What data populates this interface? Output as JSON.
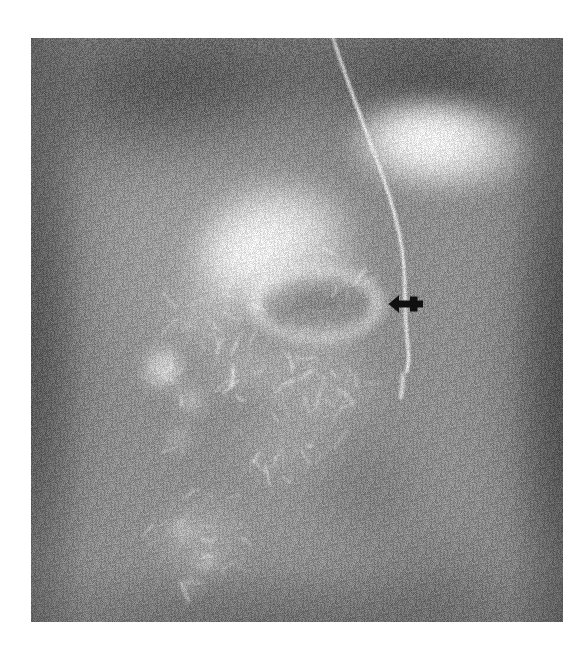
{
  "page": {
    "background_color": "#ffffff",
    "width": 587,
    "height": 653
  },
  "figure": {
    "modality": "radiograph",
    "study_type": "Barium contrast upper gastrointestinal series (abdominal radiograph)",
    "frame": {
      "left": 31,
      "top": 38,
      "width": 532,
      "height": 584
    },
    "film_base_color": "#8d8d8d",
    "grain": {
      "enabled": true,
      "amplitude": 26
    },
    "view": "anteroposterior / supine abdomen"
  },
  "annotations": [
    {
      "name": "arrow-marker",
      "icon": "arrow-left-icon",
      "direction": "left",
      "color": "#0d0d0d",
      "x": 355,
      "y": 254,
      "width": 40,
      "height": 24,
      "points_at": "ring-shaped barium-outlined lesion at the duodenal bulb / gastric antrum junction"
    }
  ],
  "anatomy_features": [
    {
      "name": "left-hemidiaphragm-shadow",
      "kind": "dark",
      "cx": 120,
      "cy": 55,
      "rx": 150,
      "ry": 70,
      "intensity": -70,
      "blur": 34
    },
    {
      "name": "right-hemidiaphragm-shadow",
      "kind": "dark",
      "cx": 430,
      "cy": 50,
      "rx": 140,
      "ry": 72,
      "intensity": -72,
      "blur": 34
    },
    {
      "name": "upper-central-dark-band",
      "kind": "dark",
      "cx": 280,
      "cy": 40,
      "rx": 190,
      "ry": 42,
      "intensity": -48,
      "blur": 30
    },
    {
      "name": "left-flank-soft-tissue",
      "kind": "dark",
      "cx": 8,
      "cy": 300,
      "rx": 46,
      "ry": 300,
      "intensity": -58,
      "blur": 30
    },
    {
      "name": "right-flank-soft-tissue",
      "kind": "dark",
      "cx": 528,
      "cy": 330,
      "rx": 52,
      "ry": 300,
      "intensity": -62,
      "blur": 30
    },
    {
      "name": "bottom-edge-shadow",
      "kind": "dark",
      "cx": 266,
      "cy": 584,
      "rx": 300,
      "ry": 40,
      "intensity": -34,
      "blur": 28
    },
    {
      "name": "liver-field",
      "kind": "light",
      "cx": 165,
      "cy": 215,
      "rx": 140,
      "ry": 145,
      "intensity": 26,
      "blur": 40
    },
    {
      "name": "stomach-body-barium",
      "kind": "light",
      "cx": 412,
      "cy": 110,
      "rx": 100,
      "ry": 52,
      "intensity": 120,
      "blur": 10
    },
    {
      "name": "stomach-fundus-barium",
      "kind": "light",
      "cx": 392,
      "cy": 96,
      "rx": 78,
      "ry": 38,
      "intensity": 120,
      "blur": 12
    },
    {
      "name": "antrum-barium-pool",
      "kind": "light",
      "cx": 248,
      "cy": 196,
      "rx": 86,
      "ry": 62,
      "intensity": 125,
      "blur": 12
    },
    {
      "name": "antrum-barium-lobe",
      "kind": "light",
      "cx": 210,
      "cy": 226,
      "rx": 62,
      "ry": 52,
      "intensity": 118,
      "blur": 14
    },
    {
      "name": "duodenal-bulb-ring",
      "kind": "ring",
      "cx": 285,
      "cy": 266,
      "rx": 62,
      "ry": 34,
      "thickness": 11,
      "intensity": 80,
      "blur": 6
    },
    {
      "name": "duodenal-ring-inner-lucency",
      "kind": "dark",
      "cx": 285,
      "cy": 266,
      "rx": 44,
      "ry": 20,
      "intensity": -26,
      "blur": 9
    },
    {
      "name": "pylorus-channel",
      "kind": "light",
      "cx": 305,
      "cy": 232,
      "rx": 46,
      "ry": 20,
      "intensity": 52,
      "blur": 12
    },
    {
      "name": "proximal-jejunum-loop",
      "kind": "light",
      "cx": 180,
      "cy": 278,
      "rx": 58,
      "ry": 34,
      "intensity": 44,
      "blur": 16
    },
    {
      "name": "duodenal-sweep-barium",
      "kind": "light",
      "cx": 290,
      "cy": 300,
      "rx": 54,
      "ry": 34,
      "intensity": 40,
      "blur": 16
    },
    {
      "name": "bowel-loop-left-upper",
      "kind": "light",
      "cx": 132,
      "cy": 330,
      "rx": 24,
      "ry": 26,
      "intensity": 98,
      "blur": 7
    },
    {
      "name": "bowel-loop-left-mid",
      "kind": "light",
      "cx": 160,
      "cy": 362,
      "rx": 16,
      "ry": 18,
      "intensity": 70,
      "blur": 8
    },
    {
      "name": "bowel-loop-left-lower",
      "kind": "light",
      "cx": 148,
      "cy": 400,
      "rx": 14,
      "ry": 14,
      "intensity": 60,
      "blur": 8
    },
    {
      "name": "jejunal-fold-cluster-a",
      "kind": "light",
      "cx": 220,
      "cy": 330,
      "rx": 58,
      "ry": 30,
      "intensity": 44,
      "blur": 14
    },
    {
      "name": "jejunal-fold-cluster-b",
      "kind": "light",
      "cx": 290,
      "cy": 352,
      "rx": 66,
      "ry": 34,
      "intensity": 40,
      "blur": 16
    },
    {
      "name": "jejunal-fold-cluster-c",
      "kind": "light",
      "cx": 256,
      "cy": 404,
      "rx": 60,
      "ry": 36,
      "intensity": 30,
      "blur": 18
    },
    {
      "name": "ileal-loop-cluster",
      "kind": "light",
      "cx": 170,
      "cy": 500,
      "rx": 52,
      "ry": 48,
      "intensity": 36,
      "blur": 14
    },
    {
      "name": "ileal-loop-bright-a",
      "kind": "light",
      "cx": 152,
      "cy": 492,
      "rx": 14,
      "ry": 12,
      "intensity": 62,
      "blur": 7
    },
    {
      "name": "ileal-loop-bright-b",
      "kind": "light",
      "cx": 176,
      "cy": 524,
      "rx": 13,
      "ry": 11,
      "intensity": 66,
      "blur": 7
    },
    {
      "name": "ileal-loop-bright-c",
      "kind": "light",
      "cx": 158,
      "cy": 548,
      "rx": 12,
      "ry": 10,
      "intensity": 58,
      "blur": 7
    },
    {
      "name": "mid-abdomen-gas",
      "kind": "dark",
      "cx": 330,
      "cy": 452,
      "rx": 60,
      "ry": 60,
      "intensity": -26,
      "blur": 24
    },
    {
      "name": "pelvic-gas-shadow",
      "kind": "dark",
      "cx": 410,
      "cy": 540,
      "rx": 80,
      "ry": 60,
      "intensity": -22,
      "blur": 26
    },
    {
      "name": "spine-column",
      "kind": "light",
      "cx": 290,
      "cy": 430,
      "rx": 42,
      "ry": 160,
      "intensity": 16,
      "blur": 34
    },
    {
      "name": "psoas-right",
      "kind": "light",
      "cx": 230,
      "cy": 470,
      "rx": 34,
      "ry": 120,
      "intensity": 12,
      "blur": 30
    }
  ],
  "tube": {
    "name": "nasogastric-catheter",
    "description": "Radiopaque enteric tube descending from the oesophagus across the stomach into the duodenum",
    "color": "#f2f2f2",
    "width": 3,
    "path": [
      [
        302,
        0
      ],
      [
        310,
        24
      ],
      [
        322,
        58
      ],
      [
        336,
        96
      ],
      [
        352,
        138
      ],
      [
        364,
        176
      ],
      [
        372,
        214
      ],
      [
        374,
        248
      ],
      [
        374,
        276
      ],
      [
        376,
        300
      ],
      [
        378,
        318
      ],
      [
        376,
        334
      ]
    ]
  },
  "catheter_tip": {
    "name": "catheter-tip",
    "x": 372,
    "y": 336,
    "length": 24
  },
  "labels": {
    "title": "",
    "caption": "",
    "figure_number": ""
  }
}
